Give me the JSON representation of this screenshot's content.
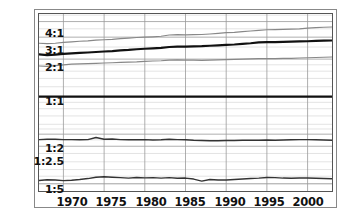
{
  "chart_data": {
    "type": "line",
    "title": "",
    "xlabel": "",
    "ylabel": "",
    "xlim": [
      1967,
      2003
    ],
    "ylim_label_scale": "log ratio",
    "grid": true,
    "legend": "none",
    "xticks": [
      1970,
      1975,
      1980,
      1985,
      1990,
      1995,
      2000
    ],
    "yticks_labeled": [
      "4:1",
      "3:1",
      "2:1",
      "1:1",
      "1:2",
      "1:2.5",
      "1:5"
    ],
    "ytick_values": [
      4.0,
      3.0,
      2.0,
      1.0,
      0.5,
      0.4,
      0.2
    ],
    "x": [
      1967,
      1968,
      1969,
      1970,
      1971,
      1972,
      1973,
      1974,
      1975,
      1976,
      1977,
      1978,
      1979,
      1980,
      1981,
      1982,
      1983,
      1984,
      1985,
      1986,
      1987,
      1988,
      1989,
      1990,
      1991,
      1992,
      1993,
      1994,
      1995,
      1996,
      1997,
      1998,
      1999,
      2000,
      2001,
      2002,
      2003
    ],
    "series": [
      {
        "name": "upper-band",
        "color": "#888888",
        "width": 1.2,
        "values": [
          2.68,
          2.66,
          2.68,
          2.72,
          2.75,
          2.78,
          2.8,
          2.84,
          2.86,
          2.88,
          2.92,
          2.95,
          2.98,
          3.0,
          3.02,
          3.05,
          3.12,
          3.14,
          3.13,
          3.14,
          3.15,
          3.18,
          3.22,
          3.26,
          3.28,
          3.32,
          3.36,
          3.4,
          3.44,
          3.45,
          3.46,
          3.48,
          3.5,
          3.54,
          3.58,
          3.6,
          3.62
        ]
      },
      {
        "name": "median-line",
        "color": "#111111",
        "width": 2.2,
        "values": [
          2.18,
          2.15,
          2.17,
          2.2,
          2.22,
          2.24,
          2.26,
          2.28,
          2.3,
          2.32,
          2.35,
          2.37,
          2.4,
          2.42,
          2.44,
          2.46,
          2.5,
          2.52,
          2.52,
          2.53,
          2.54,
          2.56,
          2.58,
          2.6,
          2.62,
          2.65,
          2.68,
          2.72,
          2.74,
          2.74,
          2.75,
          2.76,
          2.77,
          2.78,
          2.8,
          2.81,
          2.82
        ]
      },
      {
        "name": "lower-band",
        "color": "#888888",
        "width": 1.2,
        "values": [
          1.76,
          1.75,
          1.77,
          1.8,
          1.82,
          1.83,
          1.84,
          1.85,
          1.86,
          1.87,
          1.88,
          1.89,
          1.9,
          1.92,
          1.93,
          1.94,
          1.96,
          1.97,
          1.96,
          1.96,
          1.95,
          1.96,
          1.97,
          1.98,
          1.99,
          2.0,
          2.01,
          2.02,
          2.02,
          2.02,
          2.03,
          2.03,
          2.04,
          2.05,
          2.06,
          2.07,
          2.08
        ]
      },
      {
        "name": "parity-line",
        "color": "#111111",
        "width": 2.2,
        "values": [
          1.0,
          1.0,
          1.0,
          1.0,
          1.0,
          1.0,
          1.0,
          1.0,
          1.0,
          1.0,
          1.0,
          1.0,
          1.0,
          1.0,
          1.0,
          1.0,
          1.0,
          1.0,
          1.0,
          1.0,
          1.0,
          1.0,
          1.0,
          1.0,
          1.0,
          1.0,
          1.0,
          1.0,
          1.0,
          1.0,
          1.0,
          1.0,
          1.0,
          1.0,
          1.0,
          1.0,
          1.0
        ]
      },
      {
        "name": "lower-ratio-line",
        "color": "#333333",
        "width": 1.5,
        "values": [
          0.452,
          0.455,
          0.455,
          0.452,
          0.452,
          0.45,
          0.452,
          0.47,
          0.455,
          0.458,
          0.452,
          0.45,
          0.45,
          0.452,
          0.448,
          0.45,
          0.456,
          0.452,
          0.45,
          0.446,
          0.444,
          0.442,
          0.442,
          0.444,
          0.444,
          0.446,
          0.446,
          0.446,
          0.448,
          0.446,
          0.448,
          0.45,
          0.452,
          0.452,
          0.45,
          0.448,
          0.446
        ]
      },
      {
        "name": "bottom-ratio-line",
        "color": "#333333",
        "width": 1.5,
        "values": [
          0.212,
          0.215,
          0.214,
          0.212,
          0.213,
          0.216,
          0.22,
          0.226,
          0.228,
          0.226,
          0.224,
          0.222,
          0.225,
          0.223,
          0.224,
          0.222,
          0.224,
          0.221,
          0.222,
          0.218,
          0.21,
          0.216,
          0.214,
          0.214,
          0.216,
          0.218,
          0.22,
          0.222,
          0.225,
          0.224,
          0.222,
          0.221,
          0.222,
          0.222,
          0.221,
          0.22,
          0.219
        ]
      }
    ]
  },
  "axis": {
    "y_labels": [
      {
        "text": "4:1",
        "top": 28
      },
      {
        "text": "3:1",
        "top": 45
      },
      {
        "text": "2:1",
        "top": 62
      },
      {
        "text": "1:1",
        "top": 96
      },
      {
        "text": "1:2",
        "top": 143
      },
      {
        "text": "1:2.5",
        "top": 156
      },
      {
        "text": "1:5",
        "top": 184
      }
    ],
    "x_labels": [
      {
        "text": "1970",
        "left": 52
      },
      {
        "text": "1975",
        "left": 91
      },
      {
        "text": "1980",
        "left": 131
      },
      {
        "text": "1985",
        "left": 170
      },
      {
        "text": "1990",
        "left": 210
      },
      {
        "text": "1995",
        "left": 249
      },
      {
        "text": "2000",
        "left": 288
      }
    ]
  },
  "colors": {
    "grid_major": "#9a9a9a",
    "grid_minor": "#d8d8d8",
    "frame": "#888888",
    "plot_border": "#555555",
    "text": "#111111"
  }
}
